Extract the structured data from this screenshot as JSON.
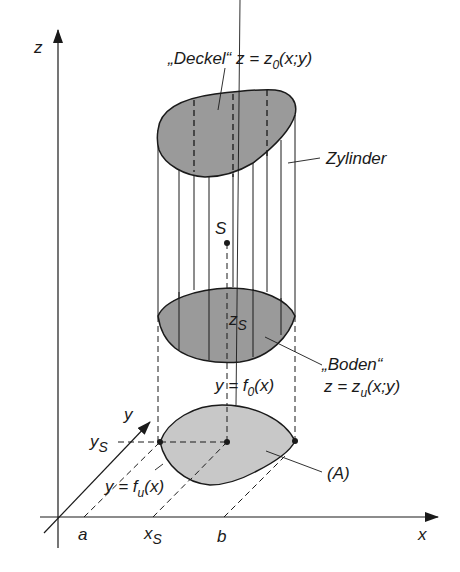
{
  "colors": {
    "line": "#1a1a1a",
    "surface_fill": "#9a9a9a",
    "base_fill": "#c8c8c8",
    "background": "#ffffff"
  },
  "axes": {
    "z_label": "z",
    "x_label": "x",
    "y_label": "y"
  },
  "ticks": {
    "a": "a",
    "xs_main": "x",
    "xs_sub": "S",
    "b": "b",
    "ys_main": "y",
    "ys_sub": "S"
  },
  "labels": {
    "deckel": "„Deckel“ z = z",
    "deckel_sub": "0",
    "deckel_args": "(x;y)",
    "zylinder": "Zylinder",
    "s_point": "S",
    "zs_main": "z",
    "zs_sub": "S",
    "boden_name": "„Boden“",
    "boden_eq": "z = z",
    "boden_sub": "u",
    "boden_args": "(x;y)",
    "f0_eq": "y = f",
    "f0_sub": "0",
    "f0_args": "(x)",
    "fu_eq": "y = f",
    "fu_sub": "u",
    "fu_args": "(x)",
    "region": "(A)"
  }
}
